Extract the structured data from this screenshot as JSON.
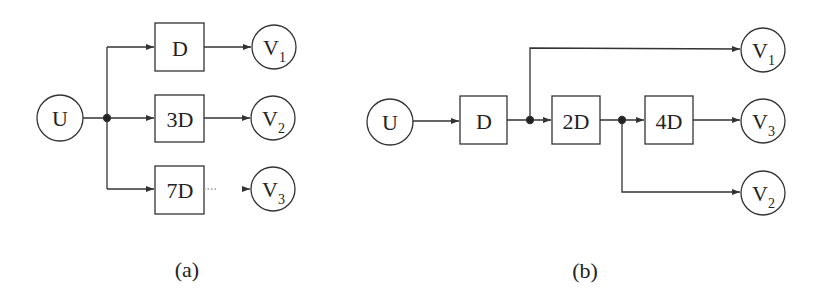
{
  "diagram_a": {
    "caption": "(a)",
    "source": {
      "label": "U"
    },
    "blocks": [
      {
        "label": "D"
      },
      {
        "label": "3D"
      },
      {
        "label": "7D"
      }
    ],
    "outputs": [
      {
        "label": "V",
        "sub": "1"
      },
      {
        "label": "V",
        "sub": "2"
      },
      {
        "label": "V",
        "sub": "3"
      }
    ]
  },
  "diagram_b": {
    "caption": "(b)",
    "source": {
      "label": "U"
    },
    "blocks": [
      {
        "label": "D"
      },
      {
        "label": "2D"
      },
      {
        "label": "4D"
      }
    ],
    "outputs": [
      {
        "label": "V",
        "sub": "1"
      },
      {
        "label": "V",
        "sub": "3"
      },
      {
        "label": "V",
        "sub": "2"
      }
    ]
  }
}
